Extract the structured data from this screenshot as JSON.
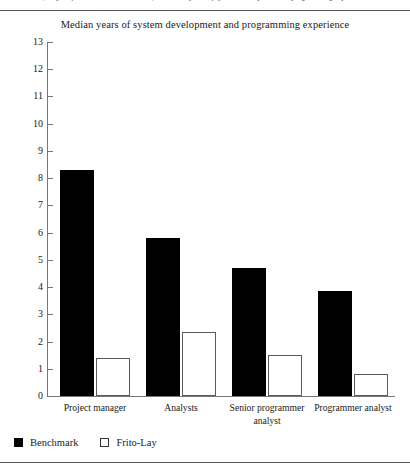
{
  "caption": {
    "text": "(Adapted from Jones & Arnett, 1994) — median years of system development and programming experience"
  },
  "chart_data": {
    "type": "bar",
    "title": "Median years of system development and programming experience",
    "xlabel": "",
    "ylabel": "",
    "ylim": [
      0,
      13
    ],
    "ytick_labels": [
      "13",
      "12",
      "11",
      "10",
      "9",
      "8",
      "7",
      "6",
      "5",
      "4",
      "3",
      "2",
      "1",
      "0"
    ],
    "ytick_values": [
      13,
      12,
      11,
      10,
      9,
      8,
      7,
      6,
      5,
      4,
      3,
      2,
      1,
      0
    ],
    "grid": false,
    "legend_position": "below-left",
    "categories": [
      "Project manager",
      "Analysts",
      "Senior programmer analyst",
      "Programmer analyst"
    ],
    "series": [
      {
        "name": "Benchmark",
        "color": "#000000",
        "values": [
          8.3,
          5.8,
          4.7,
          3.85
        ]
      },
      {
        "name": "Frito-Lay",
        "color": "#ffffff",
        "values": [
          1.4,
          2.35,
          1.5,
          0.8
        ]
      }
    ]
  },
  "legend": {
    "items": [
      {
        "label": "Benchmark",
        "style": "filled"
      },
      {
        "label": "Frito-Lay",
        "style": "open"
      }
    ]
  }
}
